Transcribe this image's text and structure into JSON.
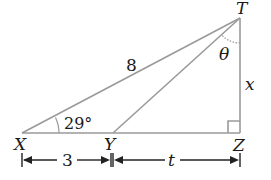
{
  "diagram": {
    "type": "right-triangle",
    "points": {
      "T": {
        "label": "T",
        "x": 240,
        "y": 18
      },
      "X": {
        "label": "X",
        "x": 22,
        "y": 133
      },
      "Y": {
        "label": "Y",
        "x": 113,
        "y": 133
      },
      "Z": {
        "label": "Z",
        "x": 240,
        "y": 133
      }
    },
    "segments": [
      {
        "from": "X",
        "to": "T",
        "label": "8"
      },
      {
        "from": "Y",
        "to": "T",
        "label": ""
      },
      {
        "from": "X",
        "to": "Z",
        "label": ""
      },
      {
        "from": "T",
        "to": "Z",
        "label": "x"
      }
    ],
    "angles": {
      "at_X": "29°",
      "at_T": "θ",
      "at_Z": "right angle"
    },
    "dimensions": {
      "XY": "3",
      "YZ": "t"
    },
    "colors": {
      "edge": "#9a9a9a",
      "text": "#1a1a1a",
      "background": "#ffffff"
    }
  }
}
